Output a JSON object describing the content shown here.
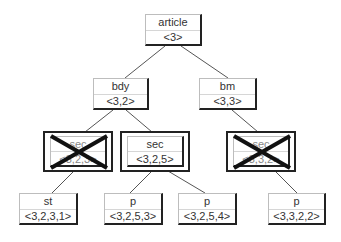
{
  "diagram": {
    "type": "tree",
    "nodes": {
      "article": {
        "label": "article",
        "id": "<3>"
      },
      "bdy": {
        "label": "bdy",
        "id": "<3,2>"
      },
      "bm": {
        "label": "bm",
        "id": "<3,3>"
      },
      "sec_left": {
        "label": "sec",
        "id": "<3,2,3>",
        "crossed_out": true
      },
      "sec_mid": {
        "label": "sec",
        "id": "<3,2,5>",
        "crossed_out": false
      },
      "sec_right": {
        "label": "sec",
        "id": "<3,3,2>",
        "crossed_out": true
      },
      "st": {
        "label": "st",
        "id": "<3,2,3,1>"
      },
      "p1": {
        "label": "p",
        "id": "<3,2,5,3>"
      },
      "p2": {
        "label": "p",
        "id": "<3,2,5,4>"
      },
      "p3": {
        "label": "p",
        "id": "<3,3,2,2>"
      }
    },
    "edges": [
      [
        "article",
        "bdy"
      ],
      [
        "article",
        "bm"
      ],
      [
        "bdy",
        "sec_left"
      ],
      [
        "bdy",
        "sec_mid"
      ],
      [
        "bm",
        "sec_right"
      ],
      [
        "sec_left",
        "st"
      ],
      [
        "sec_mid",
        "p1"
      ],
      [
        "sec_mid",
        "p2"
      ],
      [
        "sec_right",
        "p3"
      ]
    ],
    "colors": {
      "edge": "#555555",
      "border": "#222222",
      "cross": "#111111"
    }
  }
}
